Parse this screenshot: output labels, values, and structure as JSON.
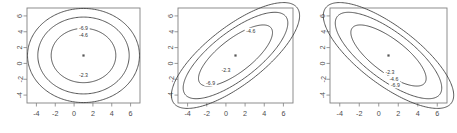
{
  "figure": {
    "title": "",
    "background_color": "#ffffff",
    "panel_count": 3
  },
  "chart_data": [
    {
      "type": "line",
      "subtype": "contour",
      "title": "",
      "xlabel": "",
      "ylabel": "",
      "xlim": [
        -5,
        7
      ],
      "ylim": [
        -5,
        7
      ],
      "xticks": [
        -4,
        -2,
        0,
        2,
        4,
        6
      ],
      "yticks": [
        -4,
        -2,
        0,
        2,
        4,
        6
      ],
      "xticklabels": [
        "-4",
        "-2",
        "0",
        "2",
        "4",
        "6"
      ],
      "yticklabels": [
        "-4",
        "-2",
        "0",
        "2",
        "4",
        "6"
      ],
      "grid": false,
      "legend": "none",
      "contour_levels": [
        -2.3,
        -4.6,
        -6.9
      ],
      "contour_labels": [
        "-2.3",
        "-4.6",
        "-6.9"
      ],
      "center": [
        1,
        1
      ],
      "correlation": 0.0,
      "sigma_x": 1.6,
      "sigma_y": 1.6,
      "label_positions": [
        {
          "text": "-6.9",
          "x": 1.0,
          "y": 4.45
        },
        {
          "text": "-4.6",
          "x": 1.0,
          "y": 3.6
        },
        {
          "text": "-2.3",
          "x": 1.0,
          "y": -1.45
        }
      ]
    },
    {
      "type": "line",
      "subtype": "contour",
      "title": "",
      "xlabel": "",
      "ylabel": "",
      "xlim": [
        -5,
        7
      ],
      "ylim": [
        -5,
        7
      ],
      "xticks": [
        -4,
        -2,
        0,
        2,
        4,
        6
      ],
      "yticks": [
        -4,
        -2,
        0,
        2,
        4,
        6
      ],
      "xticklabels": [
        "-4",
        "-2",
        "0",
        "2",
        "4",
        "6"
      ],
      "yticklabels": [
        "-4",
        "-2",
        "0",
        "2",
        "4",
        "6"
      ],
      "grid": false,
      "legend": "none",
      "contour_levels": [
        -2.3,
        -4.6,
        -6.9
      ],
      "contour_labels": [
        "-2.3",
        "-4.6",
        "-6.9"
      ],
      "center": [
        1,
        1
      ],
      "correlation": 0.75,
      "sigma_x": 1.8,
      "sigma_y": 1.8,
      "label_positions": [
        {
          "text": "-4.6",
          "x": 2.6,
          "y": 4.1
        },
        {
          "text": "-2.3",
          "x": 0.0,
          "y": -0.85
        },
        {
          "text": "-6.9",
          "x": -1.6,
          "y": -2.45
        }
      ]
    },
    {
      "type": "line",
      "subtype": "contour",
      "title": "",
      "xlabel": "",
      "ylabel": "",
      "xlim": [
        -5,
        7
      ],
      "ylim": [
        -5,
        7
      ],
      "xticks": [
        -4,
        -2,
        0,
        2,
        4,
        6
      ],
      "yticks": [
        -4,
        -2,
        0,
        2,
        4,
        6
      ],
      "xticklabels": [
        "-4",
        "-2",
        "0",
        "2",
        "4",
        "6"
      ],
      "yticklabels": [
        "-4",
        "-2",
        "0",
        "2",
        "4",
        "6"
      ],
      "grid": false,
      "legend": "none",
      "contour_levels": [
        -2.3,
        -4.6,
        -6.9
      ],
      "contour_labels": [
        "-2.3",
        "-4.6",
        "-6.9"
      ],
      "center": [
        1,
        1
      ],
      "correlation": -0.75,
      "sigma_x": 1.8,
      "sigma_y": 1.8,
      "label_positions": [
        {
          "text": "-2.3",
          "x": 1.15,
          "y": -1.05
        },
        {
          "text": "-4.6",
          "x": 1.55,
          "y": -1.95
        },
        {
          "text": "-6.9",
          "x": 1.7,
          "y": -2.75
        }
      ]
    }
  ],
  "panels": [
    {
      "name": "panel-left",
      "xticklabels": [
        "-4",
        "-2",
        "0",
        "2",
        "4",
        "6"
      ],
      "yticklabels": [
        "-4",
        "-2",
        "0",
        "2",
        "4",
        "6"
      ]
    },
    {
      "name": "panel-middle",
      "xticklabels": [
        "-4",
        "-2",
        "0",
        "2",
        "4",
        "6"
      ],
      "yticklabels": [
        "-4",
        "-2",
        "0",
        "2",
        "4",
        "6"
      ]
    },
    {
      "name": "panel-right",
      "xticklabels": [
        "-4",
        "-2",
        "0",
        "2",
        "4",
        "6"
      ],
      "yticklabels": [
        "-4",
        "-2",
        "0",
        "2",
        "4",
        "6"
      ]
    }
  ]
}
